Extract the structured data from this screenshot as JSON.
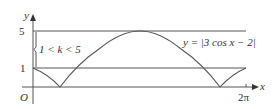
{
  "figure": {
    "axis_labels": {
      "y": "y",
      "x": "x",
      "origin": "O"
    },
    "y_ticks": [
      {
        "value": 5,
        "label": "5"
      },
      {
        "value": 1,
        "label": "1"
      }
    ],
    "x_ticks": [
      {
        "value": "2π",
        "label": "2π"
      }
    ],
    "curve_label": "y = |3 cos x − 2|",
    "region_label": "1 < k < 5",
    "colors": {
      "line": "#555555",
      "text": "#333333"
    }
  }
}
